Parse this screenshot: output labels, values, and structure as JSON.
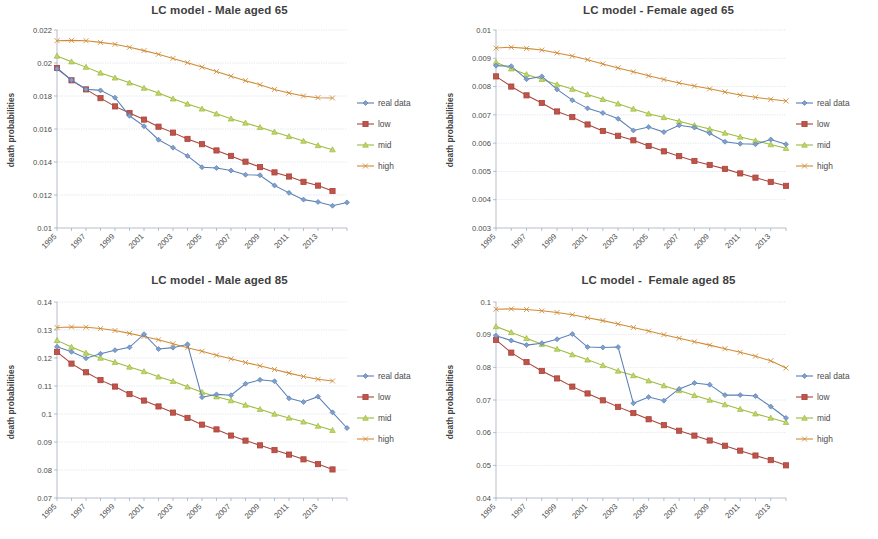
{
  "figure": {
    "background": "#ffffff",
    "panel_count": 4
  },
  "series_styles": {
    "real data": {
      "color": "#5a7fb5",
      "marker": "diamond",
      "fill": "#7fa0cc"
    },
    "low": {
      "color": "#a8443a",
      "marker": "square",
      "fill": "#c0544a"
    },
    "mid": {
      "color": "#9bbb3c",
      "marker": "triangle",
      "fill": "#c3d46b"
    },
    "high": {
      "color": "#cf8b35",
      "marker": "cross",
      "fill": "#e0a85c"
    }
  },
  "legend": {
    "entries": [
      "real data",
      "low",
      "mid",
      "high"
    ]
  },
  "axis": {
    "ylabel": "death probabilities"
  },
  "chart_data": [
    {
      "type": "line",
      "panel": "top-left",
      "title": "LC model - Male aged 65",
      "xlabel": "",
      "ylabel": "death probabilities",
      "ylim": [
        0.01,
        0.022
      ],
      "ytick_step": 0.002,
      "yticks": [
        "0.01",
        "0.012",
        "0.014",
        "0.016",
        "0.018",
        "0.02",
        "0.022"
      ],
      "x": [
        1995,
        1996,
        1997,
        1998,
        1999,
        2000,
        2001,
        2002,
        2003,
        2004,
        2005,
        2006,
        2007,
        2008,
        2009,
        2010,
        2011,
        2012,
        2013,
        2014
      ],
      "xtick_labels": [
        "1995",
        "1997",
        "1999",
        "2001",
        "2003",
        "2005",
        "2007",
        "2009",
        "2011",
        "2013"
      ],
      "grid": true,
      "legend_position": "right",
      "series": [
        {
          "name": "real data",
          "values": [
            0.01965,
            0.01897,
            0.01841,
            0.01834,
            0.0179,
            0.0168,
            0.01617,
            0.01535,
            0.01487,
            0.01437,
            0.01368,
            0.01364,
            0.01348,
            0.01323,
            0.0132,
            0.01258,
            0.01213,
            0.01172,
            0.01158,
            0.01135,
            0.01155
          ]
        },
        {
          "name": "low",
          "values": [
            0.0197,
            0.01895,
            0.0184,
            0.01787,
            0.01737,
            0.01697,
            0.01657,
            0.01614,
            0.01578,
            0.0154,
            0.01508,
            0.0147,
            0.01437,
            0.01402,
            0.01369,
            0.01337,
            0.01312,
            0.0128,
            0.01257,
            0.01224
          ]
        },
        {
          "name": "mid",
          "values": [
            0.02043,
            0.02008,
            0.01975,
            0.0194,
            0.0191,
            0.0188,
            0.01848,
            0.01818,
            0.01783,
            0.01752,
            0.01722,
            0.01692,
            0.01662,
            0.01637,
            0.0161,
            0.01582,
            0.01555,
            0.01527,
            0.015,
            0.01475
          ]
        },
        {
          "name": "high",
          "values": [
            0.02135,
            0.02137,
            0.02135,
            0.02125,
            0.02113,
            0.02095,
            0.02075,
            0.02053,
            0.02028,
            0.02002,
            0.01975,
            0.01948,
            0.0192,
            0.01893,
            0.01868,
            0.0184,
            0.01818,
            0.018,
            0.0179,
            0.01788
          ]
        }
      ]
    },
    {
      "type": "line",
      "panel": "top-right",
      "title": "LC model - Female aged 65",
      "xlabel": "",
      "ylabel": "death probabilities",
      "ylim": [
        0.003,
        0.01
      ],
      "ytick_step": 0.001,
      "yticks": [
        "0.003",
        "0.004",
        "0.005",
        "0.006",
        "0.007",
        "0.008",
        "0.009",
        "0.01"
      ],
      "x": [
        1995,
        1996,
        1997,
        1998,
        1999,
        2000,
        2001,
        2002,
        2003,
        2004,
        2005,
        2006,
        2007,
        2008,
        2009,
        2010,
        2011,
        2012,
        2013,
        2014
      ],
      "xtick_labels": [
        "1995",
        "1997",
        "1999",
        "2001",
        "2003",
        "2005",
        "2007",
        "2009",
        "2011",
        "2013"
      ],
      "grid": true,
      "legend_position": "right",
      "series": [
        {
          "name": "real data",
          "values": [
            0.00874,
            0.00872,
            0.00826,
            0.00836,
            0.0079,
            0.00752,
            0.00723,
            0.00707,
            0.00686,
            0.00645,
            0.00657,
            0.00639,
            0.00663,
            0.00655,
            0.00635,
            0.00605,
            0.00598,
            0.00596,
            0.00613,
            0.00596
          ]
        },
        {
          "name": "low",
          "values": [
            0.00836,
            0.008,
            0.00769,
            0.00742,
            0.00712,
            0.00692,
            0.00666,
            0.00643,
            0.00626,
            0.0061,
            0.0059,
            0.00571,
            0.00554,
            0.00537,
            0.00523,
            0.00509,
            0.00493,
            0.00478,
            0.00463,
            0.00449
          ]
        },
        {
          "name": "mid",
          "values": [
            0.00886,
            0.00863,
            0.00843,
            0.00826,
            0.00807,
            0.00791,
            0.00772,
            0.00755,
            0.00739,
            0.00721,
            0.00704,
            0.00691,
            0.00677,
            0.00663,
            0.0065,
            0.00636,
            0.00622,
            0.00609,
            0.00595,
            0.00582
          ]
        },
        {
          "name": "high",
          "values": [
            0.00936,
            0.00939,
            0.00935,
            0.00929,
            0.00919,
            0.00908,
            0.00895,
            0.0088,
            0.00866,
            0.00852,
            0.00838,
            0.00825,
            0.00813,
            0.00802,
            0.00792,
            0.00781,
            0.0077,
            0.00762,
            0.00755,
            0.00749
          ]
        }
      ]
    },
    {
      "type": "line",
      "panel": "bottom-left",
      "title": "LC model - Male aged 85",
      "xlabel": "",
      "ylabel": "death probabilities",
      "ylim": [
        0.07,
        0.14
      ],
      "ytick_step": 0.01,
      "yticks": [
        "0.07",
        "0.08",
        "0.09",
        "0.1",
        "0.11",
        "0.12",
        "0.13",
        "0.14"
      ],
      "x": [
        1995,
        1996,
        1997,
        1998,
        1999,
        2000,
        2001,
        2002,
        2003,
        2004,
        2005,
        2006,
        2007,
        2008,
        2009,
        2010,
        2011,
        2012,
        2013,
        2014
      ],
      "xtick_labels": [
        "1995",
        "1997",
        "1999",
        "2001",
        "2003",
        "2005",
        "2007",
        "2009",
        "2011",
        "2013"
      ],
      "grid": true,
      "legend_position": "right",
      "series": [
        {
          "name": "real data",
          "values": [
            0.124,
            0.1222,
            0.1199,
            0.1215,
            0.1228,
            0.1238,
            0.1285,
            0.1232,
            0.1237,
            0.1249,
            0.106,
            0.107,
            0.1067,
            0.1108,
            0.1122,
            0.1117,
            0.1056,
            0.1043,
            0.1062,
            0.1006,
            0.095
          ]
        },
        {
          "name": "low",
          "values": [
            0.1222,
            0.118,
            0.1149,
            0.1121,
            0.1098,
            0.1071,
            0.1048,
            0.1027,
            0.1005,
            0.0986,
            0.0962,
            0.0945,
            0.0923,
            0.0905,
            0.0888,
            0.0871,
            0.0855,
            0.0838,
            0.0821,
            0.0802
          ]
        },
        {
          "name": "mid",
          "values": [
            0.1263,
            0.1239,
            0.1218,
            0.12,
            0.1185,
            0.1168,
            0.1152,
            0.1133,
            0.1117,
            0.1097,
            0.1078,
            0.1062,
            0.1048,
            0.1032,
            0.1017,
            0.1,
            0.0986,
            0.0972,
            0.0957,
            0.0942
          ]
        },
        {
          "name": "high",
          "values": [
            0.1309,
            0.1311,
            0.131,
            0.1305,
            0.1298,
            0.1288,
            0.1277,
            0.1265,
            0.1251,
            0.1237,
            0.1224,
            0.121,
            0.1197,
            0.1184,
            0.1172,
            0.1159,
            0.1146,
            0.1134,
            0.1124,
            0.1118
          ]
        }
      ]
    },
    {
      "type": "line",
      "panel": "bottom-right",
      "title": "LC model -  Female aged 85",
      "xlabel": "",
      "ylabel": "death probabilities",
      "ylim": [
        0.04,
        0.1
      ],
      "ytick_step": 0.01,
      "yticks": [
        "0.04",
        "0.05",
        "0.06",
        "0.07",
        "0.08",
        "0.09",
        "0.1"
      ],
      "x": [
        1995,
        1996,
        1997,
        1998,
        1999,
        2000,
        2001,
        2002,
        2003,
        2004,
        2005,
        2006,
        2007,
        2008,
        2009,
        2010,
        2011,
        2012,
        2013,
        2014
      ],
      "xtick_labels": [
        "1995",
        "1997",
        "1999",
        "2001",
        "2003",
        "2005",
        "2007",
        "2009",
        "2011",
        "2013"
      ],
      "grid": true,
      "legend_position": "right",
      "series": [
        {
          "name": "real data",
          "values": [
            0.0897,
            0.0882,
            0.0868,
            0.0874,
            0.0886,
            0.0902,
            0.0862,
            0.0861,
            0.0862,
            0.069,
            0.0709,
            0.0698,
            0.0734,
            0.0752,
            0.0747,
            0.0715,
            0.0715,
            0.0712,
            0.068,
            0.0645
          ]
        },
        {
          "name": "low",
          "values": [
            0.0884,
            0.0845,
            0.0816,
            0.0789,
            0.0766,
            0.0741,
            0.072,
            0.0699,
            0.0679,
            0.066,
            0.0641,
            0.0623,
            0.0606,
            0.0591,
            0.0576,
            0.056,
            0.0545,
            0.053,
            0.0516,
            0.05
          ]
        },
        {
          "name": "mid",
          "values": [
            0.0925,
            0.0907,
            0.0889,
            0.0871,
            0.0856,
            0.0839,
            0.0823,
            0.0806,
            0.0789,
            0.0775,
            0.0759,
            0.0744,
            0.0729,
            0.0714,
            0.07,
            0.0686,
            0.0672,
            0.0658,
            0.0645,
            0.0632
          ]
        },
        {
          "name": "high",
          "values": [
            0.0978,
            0.0979,
            0.0977,
            0.0973,
            0.0968,
            0.0961,
            0.0952,
            0.0943,
            0.0933,
            0.0922,
            0.0911,
            0.09,
            0.0889,
            0.0878,
            0.0868,
            0.0857,
            0.0846,
            0.0834,
            0.082,
            0.0798
          ]
        }
      ]
    }
  ]
}
